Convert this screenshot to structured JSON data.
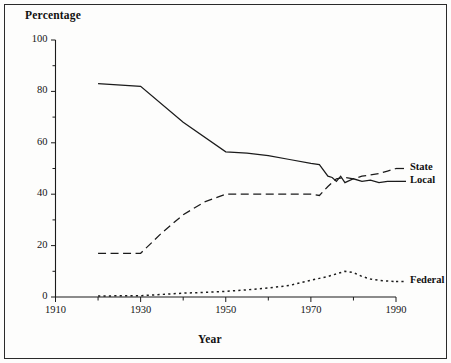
{
  "figure": {
    "border": true,
    "background_color": "#fdfdfc",
    "line_color": "#1b1b1b"
  },
  "chart_data": {
    "type": "line",
    "title": "",
    "xlabel": "Year",
    "ylabel": "Percentage",
    "xlim": [
      1910,
      1990
    ],
    "ylim": [
      0,
      100
    ],
    "grid": false,
    "legend_position": "right-inline-labels",
    "xticks": [
      1910,
      1930,
      1950,
      1970,
      1990
    ],
    "xticks_minor": [
      1920,
      1940,
      1960,
      1980
    ],
    "yticks": [
      0,
      20,
      40,
      60,
      80,
      100
    ],
    "yticks_minor": [
      10,
      30,
      50,
      70,
      90
    ],
    "xtick_labels": [
      "1910",
      "1930",
      "1950",
      "1970",
      "1990"
    ],
    "ytick_labels": [
      "0",
      "20",
      "40",
      "60",
      "80",
      "100"
    ],
    "series": [
      {
        "name": "Local",
        "style": "solid",
        "label": "Local",
        "x": [
          1920,
          1930,
          1940,
          1950,
          1955,
          1960,
          1965,
          1970,
          1972,
          1974,
          1975,
          1976,
          1977,
          1978,
          1980,
          1982,
          1984,
          1986,
          1988,
          1990
        ],
        "values": [
          83,
          82,
          68,
          56.5,
          56,
          55,
          53.5,
          52,
          51.5,
          47,
          46.5,
          45,
          47,
          44.5,
          46,
          45,
          45.5,
          44.5,
          45,
          45
        ]
      },
      {
        "name": "State",
        "style": "dashed",
        "label": "State",
        "x": [
          1920,
          1930,
          1935,
          1940,
          1945,
          1950,
          1955,
          1960,
          1965,
          1970,
          1972,
          1974,
          1976,
          1978,
          1980,
          1982,
          1984,
          1986,
          1988,
          1990
        ],
        "values": [
          17,
          17,
          25,
          32,
          37,
          40,
          40,
          40,
          40,
          40,
          39.5,
          43,
          46,
          46.5,
          46,
          47,
          47.5,
          48,
          49,
          50
        ]
      },
      {
        "name": "Federal",
        "style": "dotted",
        "label": "Federal",
        "x": [
          1920,
          1930,
          1935,
          1940,
          1945,
          1950,
          1955,
          1960,
          1965,
          1970,
          1974,
          1976,
          1978,
          1980,
          1982,
          1984,
          1986,
          1988,
          1990
        ],
        "values": [
          0.4,
          0.5,
          1.0,
          1.5,
          1.8,
          2.2,
          2.8,
          3.5,
          4.5,
          6.5,
          8.0,
          9.0,
          10.0,
          9.5,
          8.0,
          7.0,
          6.5,
          6.2,
          6.0
        ]
      }
    ]
  },
  "labels": {
    "state": "State",
    "local": "Local",
    "federal": "Federal"
  }
}
